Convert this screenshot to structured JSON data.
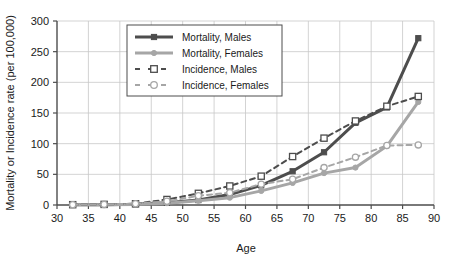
{
  "chart_data": {
    "type": "line",
    "title": "",
    "xlabel": "Age",
    "ylabel": "Mortality or Incidence rate (per 100,000)",
    "xlim": [
      30,
      90
    ],
    "ylim": [
      0,
      300
    ],
    "xticks": [
      30,
      35,
      40,
      45,
      50,
      55,
      60,
      65,
      70,
      75,
      80,
      85,
      90
    ],
    "yticks": [
      0,
      50,
      100,
      150,
      200,
      250,
      300
    ],
    "xtick_labels": [
      "30",
      "35",
      "40",
      "45",
      "50",
      "55",
      "60",
      "65",
      "70",
      "75",
      "80",
      "85",
      "90"
    ],
    "ytick_labels": [
      "0",
      "50",
      "100",
      "150",
      "200",
      "250",
      "300"
    ],
    "grid": true,
    "legend_position": "upper-left-inside",
    "x": [
      32.5,
      37.5,
      42.5,
      47.5,
      52.5,
      57.5,
      62.5,
      67.5,
      72.5,
      77.5,
      82.5,
      87.5
    ],
    "series": [
      {
        "name": "Mortality, Males",
        "values": [
          0.3,
          0.6,
          1.2,
          3.5,
          8,
          17,
          32,
          55,
          86,
          134,
          159,
          272
        ],
        "color": "#4d4d4d",
        "marker": "square-filled",
        "line_style": "solid",
        "line_width": 3
      },
      {
        "name": "Mortality, Females",
        "values": [
          0.3,
          0.6,
          1.0,
          3.0,
          7,
          12,
          23,
          36,
          52,
          61,
          96,
          168
        ],
        "color": "#a6a6a6",
        "marker": "circle-filled",
        "line_style": "solid",
        "line_width": 3
      },
      {
        "name": "Incidence, Males",
        "values": [
          0.5,
          1.0,
          2.0,
          9,
          19,
          31,
          47,
          79,
          109,
          137,
          161,
          177
        ],
        "color": "#4d4d4d",
        "marker": "square-open",
        "line_style": "dashed",
        "line_width": 2
      },
      {
        "name": "Incidence, Females",
        "values": [
          0.5,
          1.0,
          2.0,
          6,
          15,
          20,
          34,
          42,
          61,
          78,
          97,
          98
        ],
        "color": "#a6a6a6",
        "marker": "circle-open",
        "line_style": "dashed",
        "line_width": 2
      }
    ]
  },
  "legend": {
    "items": [
      {
        "label": "Mortality, Males"
      },
      {
        "label": "Mortality, Females"
      },
      {
        "label": "Incidence, Males"
      },
      {
        "label": "Incidence, Females"
      }
    ]
  },
  "colors": {
    "dark_gray": "#4d4d4d",
    "light_gray": "#a6a6a6",
    "grid": "#c8c8c8",
    "axis": "#4d4d4d",
    "text": "#1a1a1a",
    "background": "#ffffff"
  }
}
